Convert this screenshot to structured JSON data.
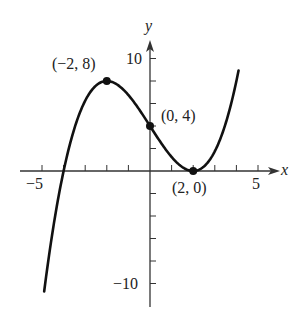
{
  "chart_data": {
    "type": "line",
    "title": "",
    "xlabel": "x",
    "ylabel": "y",
    "function": "y = x^3/4 - 3x + 4",
    "xlim": [
      -5,
      5
    ],
    "ylim": [
      -10,
      10
    ],
    "x_ticks": [
      -5,
      -4,
      -3,
      -2,
      -1,
      0,
      1,
      2,
      3,
      4,
      5
    ],
    "x_tick_labels": [
      "-5",
      "5"
    ],
    "y_ticks": [
      -10,
      -8,
      -6,
      -4,
      -2,
      0,
      2,
      4,
      6,
      8,
      10
    ],
    "y_tick_labels": [
      "10",
      "-10"
    ],
    "grid": false,
    "points": [
      {
        "x": -2,
        "y": 8,
        "label": "(−2, 8)"
      },
      {
        "x": 0,
        "y": 4,
        "label": "(0, 4)"
      },
      {
        "x": 2,
        "y": 0,
        "label": "(2, 0)"
      }
    ],
    "curve_domain": [
      -4.9,
      4.1
    ]
  },
  "labels": {
    "x_axis": "x",
    "y_axis": "y",
    "x_neg5": "−5",
    "x_pos5": "5",
    "y_pos10": "10",
    "y_neg10": "−10",
    "pt_max": "(−2, 8)",
    "pt_int": "(0, 4)",
    "pt_min": "(2, 0)"
  }
}
